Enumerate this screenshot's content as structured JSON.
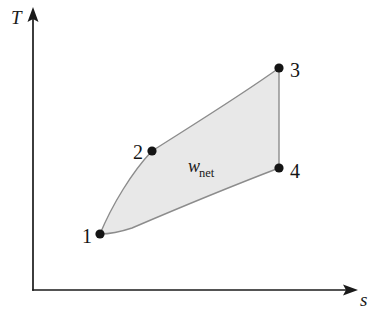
{
  "figure": {
    "kind": "thermodynamic-ts-diagram",
    "background_color": "#ffffff",
    "width": 387,
    "height": 317
  },
  "axes": {
    "y_label": "T",
    "x_label": "s",
    "line_color": "#1a1a1a",
    "origin": {
      "x": 33,
      "y": 290
    },
    "y_tip": {
      "x": 33,
      "y": 10
    },
    "x_tip": {
      "x": 355,
      "y": 290
    },
    "y_label_pos": {
      "x": 11,
      "y": 24
    },
    "x_label_pos": {
      "x": 360,
      "y": 306
    }
  },
  "cycle": {
    "fill_color": "#e8e8e8",
    "edge_color": "#8c8c8c",
    "dot_color": "#141414",
    "dot_radius": 4.6,
    "states": [
      {
        "id": "1",
        "label": "1",
        "x": 100,
        "y": 234,
        "label_x": 82,
        "label_y": 243,
        "label_anchor": "start"
      },
      {
        "id": "2",
        "label": "2",
        "x": 152,
        "y": 151,
        "label_x": 133,
        "label_y": 159,
        "label_anchor": "start"
      },
      {
        "id": "3",
        "label": "3",
        "x": 279,
        "y": 68,
        "label_x": 290,
        "label_y": 77,
        "label_anchor": "start"
      },
      {
        "id": "4",
        "label": "4",
        "x": 279,
        "y": 168,
        "label_x": 290,
        "label_y": 178,
        "label_anchor": "start"
      }
    ],
    "path": "M 100 234 C 112 205, 132 172, 152 151 C 188 128, 240 96, 279 68 L 279 168 C 232 186, 160 216, 132 228 C 120 232, 108 234, 100 234 Z",
    "edge_1_to_2": "M 100 234 C 112 205, 132 172, 152 151",
    "edge_2_to_3": "M 152 151 C 188 128, 240 96, 279 68",
    "edge_3_to_4": "M 279 68 L 279 168",
    "edge_1_to_4": "M 100 234 C 108 234, 120 232, 132 228 C 160 216, 232 186, 279 168"
  },
  "annotations": {
    "work": {
      "symbol": "w",
      "subscript": "net",
      "x": 188,
      "y": 172,
      "sub_dx": 11,
      "sub_dy": 5
    }
  }
}
